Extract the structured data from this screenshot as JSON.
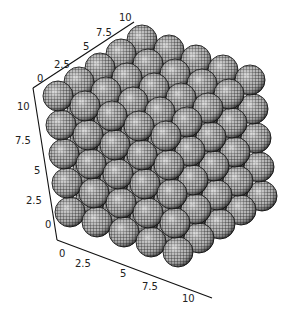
{
  "chart_data": {
    "type": "3d-surface",
    "title": "",
    "axes": {
      "x": {
        "label": "",
        "range": [
          0,
          10
        ],
        "ticks": [
          "0",
          "2.5",
          "5",
          "7.5",
          "10"
        ]
      },
      "y": {
        "label": "",
        "range": [
          0,
          10
        ],
        "ticks": [
          "0",
          "2.5",
          "5",
          "7.5",
          "10"
        ]
      },
      "z": {
        "label": "",
        "range": [
          0,
          10
        ],
        "ticks": [
          "0",
          "2.5",
          "5",
          "7.5",
          "10"
        ]
      }
    },
    "lattice": {
      "nx": 5,
      "ny": 5,
      "nz": 5
    },
    "grid": false,
    "legend": null,
    "colors": {
      "surface": "#7a7a7a",
      "mesh": "#1a1a1a",
      "highlight": "#e6e6e6",
      "axis": "#111111"
    }
  },
  "axis_labels": {
    "top": [
      "0",
      "2.5",
      "5",
      "7.5",
      "10"
    ],
    "left": [
      "10",
      "7.5",
      "5",
      "2.5",
      "0"
    ],
    "bottom": [
      "0",
      "2.5",
      "5",
      "7.5",
      "10"
    ]
  }
}
